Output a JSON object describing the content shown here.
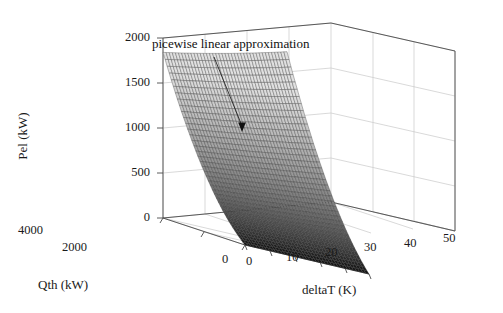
{
  "chart_data": {
    "type": "surface",
    "title": "",
    "xlabel": "deltaT (K)",
    "ylabel": "Qth (kW)",
    "zlabel": "Pel (kW)",
    "x_ticks": [
      "0",
      "10",
      "20",
      "30",
      "40",
      "50"
    ],
    "x_values": [
      0,
      10,
      20,
      30,
      40,
      50
    ],
    "y_ticks": [
      "4000",
      "2000",
      "0"
    ],
    "y_values": [
      4000,
      2000,
      0
    ],
    "z_ticks": [
      "0",
      "500",
      "1000",
      "1500",
      "2000"
    ],
    "z_values": [
      0,
      500,
      1000,
      1500,
      2000
    ],
    "xlim": [
      0,
      50
    ],
    "ylim": [
      0,
      4000
    ],
    "zlim": [
      0,
      2000
    ],
    "grid": true,
    "legend": "none",
    "colormap": "gray",
    "mesh": true,
    "annotations": [
      {
        "text": "picewise linear approximation",
        "arrow": true,
        "target_x_deltaT": 8,
        "target_y_Qth": 3500,
        "target_z_Pel": 700
      }
    ],
    "surface_description": "Pel rises steeply with Qth and deltaT; peak near Pel=1700 kW at high Qth / low deltaT corner, minimum near 0 kW at low Qth",
    "surface_samples": {
      "deltaT": [
        0,
        10,
        20,
        30,
        40,
        50
      ],
      "Qth": [
        0,
        1000,
        2000,
        3000,
        4000
      ],
      "Pel": [
        [
          0,
          20,
          45,
          75,
          110,
          150
        ],
        [
          120,
          170,
          230,
          300,
          380,
          470
        ],
        [
          320,
          400,
          500,
          610,
          740,
          880
        ],
        [
          620,
          730,
          860,
          1010,
          1180,
          1360
        ],
        [
          1000,
          1150,
          1320,
          1510,
          1720,
          1950
        ]
      ]
    }
  },
  "axes": {
    "z_label": "Pel (kW)",
    "y_label": "Qth (kW)",
    "x_label": "deltaT (K)",
    "z_tick_labels": [
      "2000",
      "1500",
      "1000",
      "500",
      "0"
    ],
    "y_tick_labels": [
      "4000",
      "2000",
      "0"
    ],
    "x_tick_labels": [
      "0",
      "10",
      "20",
      "30",
      "40",
      "50"
    ]
  },
  "annotation": {
    "text": "picewise linear approximation"
  },
  "colors": {
    "background": "#ffffff",
    "axis_line": "#555555",
    "grid_line": "#c8c8c8",
    "text": "#1a1a1a",
    "mesh_light": "#b5b5b5",
    "mesh_mid": "#787878",
    "mesh_dark": "#2b2b2b"
  }
}
